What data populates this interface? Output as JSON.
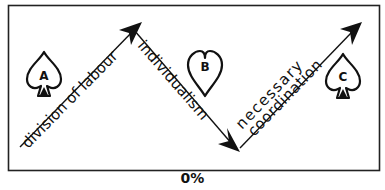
{
  "diagram": {
    "type": "zigzag-flow",
    "caption": "0%",
    "colors": {
      "ink": "#111111",
      "background": "#ffffff"
    },
    "arrows": [
      {
        "id": "arrow-1",
        "direction": "up-right",
        "label": "division of labour"
      },
      {
        "id": "arrow-2",
        "direction": "down-right",
        "label": "individualism"
      },
      {
        "id": "arrow-3",
        "direction": "up-right",
        "label_line1": "necessary",
        "label_line2": "coordination"
      }
    ],
    "symbols": [
      {
        "id": "A",
        "shape": "spade",
        "letter": "A"
      },
      {
        "id": "B",
        "shape": "heart",
        "letter": "B"
      },
      {
        "id": "C",
        "shape": "spade",
        "letter": "C"
      }
    ]
  }
}
